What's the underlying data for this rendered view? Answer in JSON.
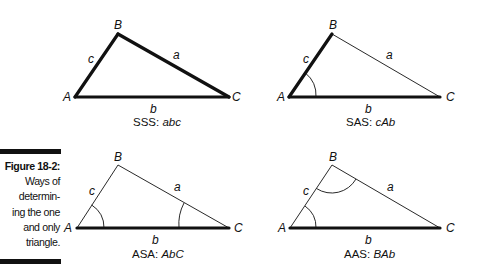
{
  "figure": {
    "label": "Figure 18-2:",
    "caption_lines": [
      "Ways of",
      "determin-",
      "ing the one",
      "and only",
      "triangle."
    ]
  },
  "panels": [
    {
      "id": "sss",
      "title_prefix": "SSS: ",
      "title_italic": "abc",
      "vertices": {
        "A": "A",
        "B": "B",
        "C": "C"
      },
      "sides": {
        "a": "a",
        "b": "b",
        "c": "c"
      },
      "bold_sides": [
        "a",
        "b",
        "c"
      ],
      "angle_arcs": []
    },
    {
      "id": "sas",
      "title_prefix": "SAS: ",
      "title_italic": "cAb",
      "vertices": {
        "A": "A",
        "B": "B",
        "C": "C"
      },
      "sides": {
        "a": "a",
        "b": "b",
        "c": "c"
      },
      "bold_sides": [
        "b",
        "c"
      ],
      "angle_arcs": [
        "A"
      ]
    },
    {
      "id": "asa",
      "title_prefix": "ASA: ",
      "title_italic": "AbC",
      "vertices": {
        "A": "A",
        "B": "B",
        "C": "C"
      },
      "sides": {
        "a": "a",
        "b": "b",
        "c": "c"
      },
      "bold_sides": [
        "b"
      ],
      "angle_arcs": [
        "A",
        "C"
      ]
    },
    {
      "id": "aas",
      "title_prefix": "AAS: ",
      "title_italic": "BAb",
      "vertices": {
        "A": "A",
        "B": "B",
        "C": "C"
      },
      "sides": {
        "a": "a",
        "b": "b",
        "c": "c"
      },
      "bold_sides": [
        "b"
      ],
      "angle_arcs": [
        "B",
        "A"
      ]
    }
  ],
  "colors": {
    "ink": "#111111",
    "background": "#ffffff"
  }
}
